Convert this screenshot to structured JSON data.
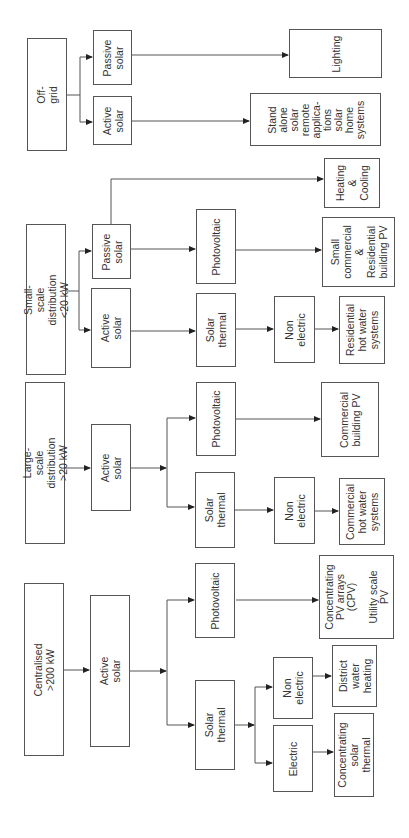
{
  "diagram": {
    "orientation": "rotated-90-ccw",
    "groups": [
      {
        "id": "off-grid",
        "root": "Off-grid",
        "branches": [
          {
            "type": "Passive solar",
            "outputs": [
              "Lighting"
            ]
          },
          {
            "type": "Active solar",
            "outputs": [
              "Stand alone solar remote applications solar home systems"
            ]
          }
        ]
      },
      {
        "id": "small-scale",
        "root": "Small-scale distribution <20 kW",
        "branches": [
          {
            "type": "Passive solar",
            "outputs": [
              "Heating & Cooling"
            ],
            "sub": [
              {
                "type": "Photovoltaic",
                "outputs": [
                  "Small commercial & Residential building PV"
                ]
              }
            ]
          },
          {
            "type": "Active solar",
            "sub": [
              {
                "type": "Solar thermal",
                "sub": [
                  {
                    "type": "Non electric",
                    "outputs": [
                      "Residential hot water systems"
                    ]
                  }
                ]
              }
            ]
          }
        ]
      },
      {
        "id": "large-scale",
        "root": "Large-scale distribution >20 kW",
        "branches": [
          {
            "type": "Active solar",
            "sub": [
              {
                "type": "Photovoltaic",
                "outputs": [
                  "Commercial building PV"
                ]
              },
              {
                "type": "Solar thermal",
                "sub": [
                  {
                    "type": "Non electric",
                    "outputs": [
                      "Commercial hot water systems"
                    ]
                  }
                ]
              }
            ]
          }
        ]
      },
      {
        "id": "centralised",
        "root": "Centralised >200 kW",
        "branches": [
          {
            "type": "Active solar",
            "sub": [
              {
                "type": "Photovoltaic",
                "outputs": [
                  "Concentrating PV arrays (CPV) Utility scale PV"
                ]
              },
              {
                "type": "Solar thermal",
                "sub": [
                  {
                    "type": "Non electric",
                    "outputs": [
                      "District water heating"
                    ]
                  },
                  {
                    "type": "Electric",
                    "outputs": [
                      "Concentrating solar thermal"
                    ]
                  }
                ]
              }
            ]
          }
        ]
      }
    ]
  },
  "boxes": {
    "offgrid": "Off-grid",
    "og_passive": "Passive\nsolar",
    "og_active": "Active\nsolar",
    "og_lighting": "Lighting",
    "og_standalone": "Stand\nalone\nsolar\nremote\napplica-\ntions\nsolar\nhome\nsystems",
    "ss_heating": "Heating\n&\nCooling",
    "ss_root": "Small-scale distribution\n<20 kW",
    "ss_passive": "Passive\nsolar",
    "ss_active": "Active solar",
    "ss_pv": "Photovoltaic",
    "ss_smallcomm": "Small\ncommercial\n&\nResidential\nbuilding PV",
    "ss_thermal": "Solar\nthermal",
    "ss_nonelec": "Non\nelectric",
    "ss_reshw": "Residential\nhot water\nsystems",
    "ls_root": "Large-scale distribution\n>20 kW",
    "ls_active": "Active solar",
    "ls_pv": "Photovoltaic",
    "ls_commpv": "Commercial\nbuilding PV",
    "ls_thermal": "Solar\nthermal",
    "ls_nonelec": "Non\nelectric",
    "ls_commhw": "Commercial\nhot water\nsystems",
    "c_root": "Centralised\n>200 kW",
    "c_active": "Active solar",
    "c_pv": "Photovoltaic",
    "c_cpv": "Concentrating\nPV arrays\n(CPV)\n\nUtility scale\nPV",
    "c_thermal": "Solar thermal",
    "c_nonelec": "Non\nelectric",
    "c_district": "District\nwater\nheating",
    "c_electric": "Electric",
    "c_cst": "Concentrating\nsolar\nthermal"
  },
  "colors": {
    "stroke": "#555555",
    "text": "#333333",
    "background": "#ffffff"
  }
}
